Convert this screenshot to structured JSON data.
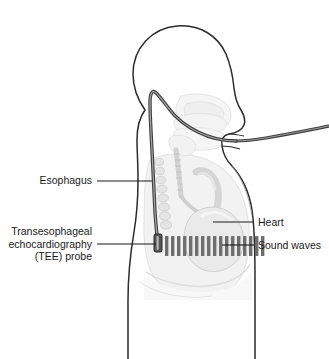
{
  "figure": {
    "background_color": "#ffffff",
    "outline_color": "#2b2b2b",
    "anatomy_fill": "#f4f4f4",
    "anatomy_stroke": "#c9c9c9",
    "leader_color": "#1a1a1a",
    "probe_color": "#4a4a4a",
    "sound_wave_color": "#6e6e6e"
  },
  "labels": {
    "esophagus": "Esophagus",
    "tee_line1": "Transesophageal",
    "tee_line2": "echocardiography",
    "tee_line3": "(TEE) probe",
    "heart": "Heart",
    "sound_waves": "Sound waves"
  },
  "anatomy_parts": [
    {
      "name": "head-profile",
      "description": "Lateral view of head facing right"
    },
    {
      "name": "neck",
      "description": "Neck with airway"
    },
    {
      "name": "torso",
      "description": "Upper torso and chest"
    },
    {
      "name": "mouth-opening",
      "description": "Open mouth where probe enters"
    },
    {
      "name": "trachea",
      "description": "Trachea descending into chest"
    },
    {
      "name": "vertebral-column",
      "description": "Spine with vertebrae"
    },
    {
      "name": "lung-field",
      "description": "Lung shadow"
    },
    {
      "name": "heart",
      "description": "Heart in mediastinum"
    },
    {
      "name": "diaphragm",
      "description": "Diaphragm below heart"
    }
  ],
  "probe": {
    "name": "tee-probe",
    "description": "Flexible probe inserted through the mouth down the esophagus",
    "tip_position": "posterior to heart"
  },
  "sound_waves": {
    "count": 17,
    "direction": "anterior toward heart",
    "description": "Ultrasound beam bars projecting from probe tip"
  },
  "leaders": [
    {
      "name": "esophagus-leader",
      "from_label": "esophagus"
    },
    {
      "name": "tee-probe-leader",
      "from_label": "tee_line2"
    },
    {
      "name": "heart-leader",
      "from_label": "heart"
    },
    {
      "name": "sound-waves-leader",
      "from_label": "sound_waves"
    }
  ]
}
